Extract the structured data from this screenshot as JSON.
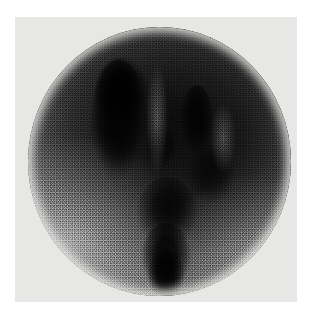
{
  "image": {
    "modality": "nuclear-medicine-scintigraphy",
    "study": "thyroid scintigram",
    "view": "anterior planar",
    "caption": "",
    "annotations": [],
    "overlay_text": []
  },
  "canvas": {
    "width": 313,
    "height": 317,
    "page_background": "#ffffff"
  },
  "plate": {
    "background": "#e7e7e5",
    "left": 15,
    "top": 17,
    "width": 282,
    "height": 285
  },
  "field_of_view": {
    "shape": "circle",
    "center_x": 159,
    "center_y": 161,
    "radius": 132,
    "base_color": "#9a9a9a",
    "rim_color": "#b2b2b2",
    "core_color": "#050505"
  },
  "uptake_regions": [
    {
      "name": "left-lobe",
      "intensity": "intense",
      "gray_level": "#050505",
      "shape": "elongated-vertical-oval"
    },
    {
      "name": "left-lobe-superior-pole",
      "intensity": "intense",
      "gray_level": "#060606",
      "shape": "bulbous-oval"
    },
    {
      "name": "right-lobe",
      "intensity": "intense",
      "gray_level": "#0b0b0b",
      "shape": "narrow-vertical-oval"
    },
    {
      "name": "right-lobe-inferior",
      "intensity": "moderate",
      "gray_level": "#232323",
      "shape": "round"
    },
    {
      "name": "mid-node",
      "intensity": "moderate",
      "gray_level": "#1c1c1c",
      "shape": "small-oval"
    },
    {
      "name": "isthmus",
      "intensity": "intense",
      "gray_level": "#0a0a0a",
      "shape": "broad-vertical-band"
    },
    {
      "name": "inferior-tract",
      "intensity": "intense",
      "gray_level": "#050505",
      "shape": "tapering-vertical-band"
    },
    {
      "name": "inferior-tract-tip",
      "intensity": "intense",
      "gray_level": "#070707",
      "shape": "rounded-tip"
    }
  ],
  "cold_regions": [
    {
      "name": "interlobar-cleft",
      "intensity": "photopenic"
    },
    {
      "name": "right-lateral-gap",
      "intensity": "photopenic"
    },
    {
      "name": "inferolateral-washout",
      "intensity": "low-count"
    }
  ],
  "texture": {
    "type": "photon-count-speckle",
    "grain": "fine"
  }
}
